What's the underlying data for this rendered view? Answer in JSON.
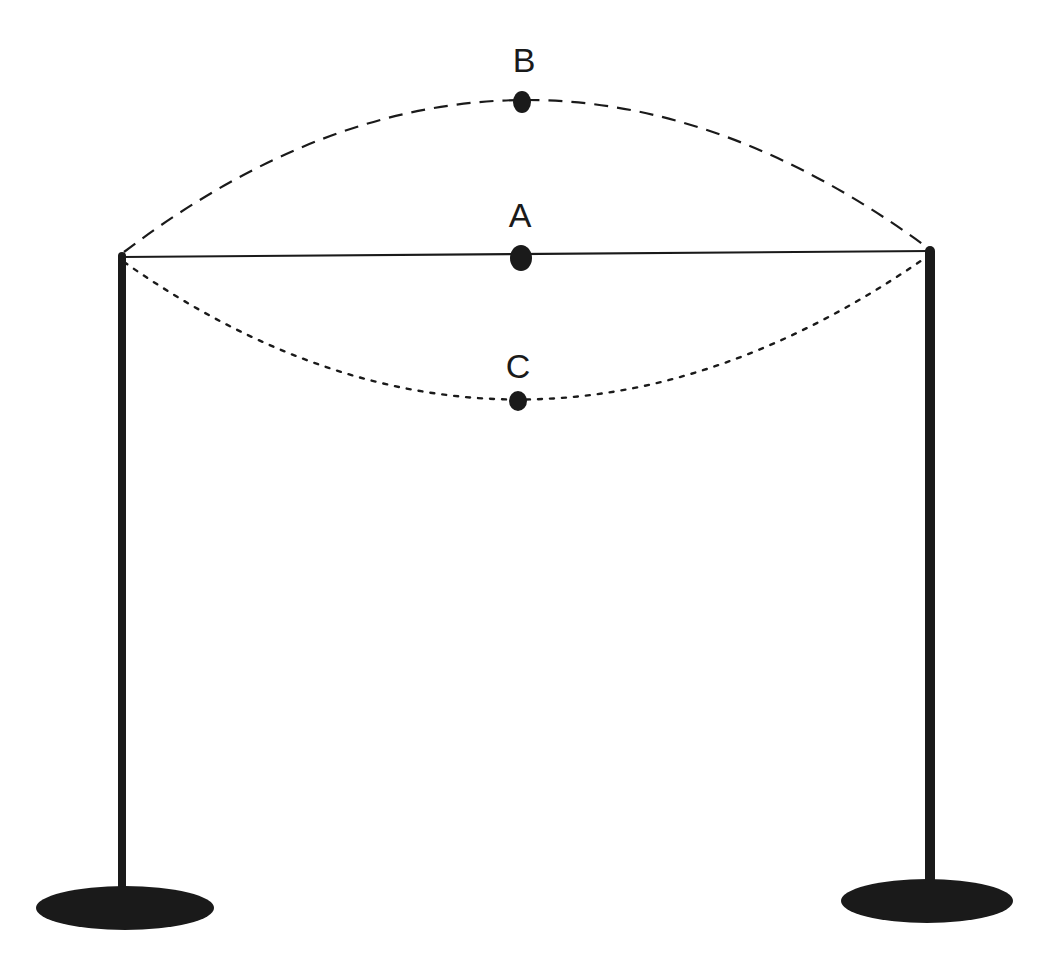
{
  "diagram": {
    "colors": {
      "ink": "#1a1a1a",
      "background": "#ffffff"
    },
    "poles": [
      {
        "id": "left",
        "x": 122,
        "top_y": 254,
        "bottom_y": 895,
        "base": {
          "cx": 125,
          "cy": 908,
          "rx": 89,
          "ry": 22
        }
      },
      {
        "id": "right",
        "x": 930,
        "top_y": 248,
        "bottom_y": 888,
        "base": {
          "cx": 927,
          "cy": 901,
          "rx": 86,
          "ry": 22
        }
      }
    ],
    "positions": [
      {
        "id": "A",
        "label": "A",
        "style": "solid",
        "description": "rest / equilibrium position",
        "point": {
          "x": 520,
          "y": 258
        },
        "label_pos": {
          "x": 520,
          "y": 226
        }
      },
      {
        "id": "B",
        "label": "B",
        "style": "dashed",
        "description": "maximum upward displacement",
        "point": {
          "x": 522,
          "y": 102
        },
        "label_pos": {
          "x": 524,
          "y": 72
        }
      },
      {
        "id": "C",
        "label": "C",
        "style": "dotted",
        "description": "maximum downward displacement",
        "point": {
          "x": 518,
          "y": 401
        },
        "label_pos": {
          "x": 518,
          "y": 378
        }
      }
    ]
  }
}
